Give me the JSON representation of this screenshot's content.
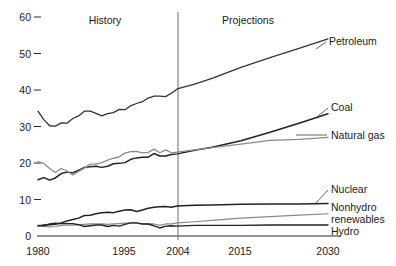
{
  "chart_data": {
    "type": "line",
    "title": "",
    "xlabel": "",
    "ylabel": "",
    "xlim": [
      1980,
      2030
    ],
    "ylim": [
      0,
      62
    ],
    "grid": false,
    "legend_position": "right-inline-labels",
    "x_ticks": [
      1980,
      1995,
      2004,
      2015,
      2030
    ],
    "y_ticks": [
      0,
      10,
      20,
      30,
      40,
      50,
      60
    ],
    "annotations": [
      {
        "text": "History",
        "x": 1991,
        "y": 60
      },
      {
        "text": "Projections",
        "x": 2016,
        "y": 60
      }
    ],
    "divider_x": 2004,
    "series": [
      {
        "name": "Petroleum",
        "color": "#333333",
        "width": 1.3,
        "label_x": 2031,
        "label_y": 52,
        "x": [
          1980,
          1981,
          1982,
          1983,
          1984,
          1985,
          1986,
          1987,
          1988,
          1989,
          1990,
          1991,
          1992,
          1993,
          1994,
          1995,
          1996,
          1997,
          1998,
          1999,
          2000,
          2001,
          2002,
          2003,
          2004,
          2007,
          2010,
          2015,
          2020,
          2025,
          2030
        ],
        "y": [
          34.2,
          31.9,
          30.2,
          30.1,
          31.0,
          30.9,
          32.2,
          32.9,
          34.2,
          34.2,
          33.6,
          32.9,
          33.5,
          33.8,
          34.7,
          34.6,
          35.7,
          36.3,
          36.8,
          37.8,
          38.3,
          38.3,
          38.2,
          39.1,
          40.3,
          41.6,
          43.2,
          46.2,
          48.9,
          51.4,
          54.0
        ]
      },
      {
        "name": "Coal",
        "color": "#222222",
        "width": 1.5,
        "label_x": 2031,
        "label_y": 34,
        "x": [
          1980,
          1981,
          1982,
          1983,
          1984,
          1985,
          1986,
          1987,
          1988,
          1989,
          1990,
          1991,
          1992,
          1993,
          1994,
          1995,
          1996,
          1997,
          1998,
          1999,
          2000,
          2001,
          2002,
          2003,
          2004,
          2007,
          2010,
          2015,
          2020,
          2025,
          2030
        ],
        "y": [
          15.4,
          16.0,
          15.3,
          15.9,
          17.1,
          17.5,
          17.3,
          18.0,
          18.8,
          19.0,
          19.1,
          18.8,
          19.1,
          19.8,
          19.9,
          20.1,
          21.0,
          21.4,
          21.6,
          21.6,
          22.6,
          21.9,
          21.9,
          22.3,
          22.5,
          23.5,
          24.3,
          26.1,
          28.4,
          30.9,
          33.5
        ]
      },
      {
        "name": "Natural gas",
        "color": "#8a8a8a",
        "width": 1.3,
        "label_x": 2031,
        "label_y": 28,
        "x": [
          1980,
          1981,
          1982,
          1983,
          1984,
          1985,
          1986,
          1987,
          1988,
          1989,
          1990,
          1991,
          1992,
          1993,
          1994,
          1995,
          1996,
          1997,
          1998,
          1999,
          2000,
          2001,
          2002,
          2003,
          2004,
          2007,
          2010,
          2015,
          2020,
          2025,
          2030
        ],
        "y": [
          20.4,
          19.9,
          18.5,
          17.4,
          18.5,
          17.8,
          16.7,
          17.7,
          18.6,
          19.7,
          19.7,
          20.1,
          20.8,
          21.3,
          21.7,
          22.7,
          23.1,
          23.2,
          22.8,
          22.9,
          23.8,
          22.8,
          23.6,
          22.8,
          23.0,
          23.6,
          24.2,
          25.2,
          26.2,
          26.5,
          27.0
        ]
      },
      {
        "name": "Nuclear",
        "color": "#222222",
        "width": 1.5,
        "label_x": 2031,
        "label_y": 11.5,
        "x": [
          1980,
          1981,
          1982,
          1983,
          1984,
          1985,
          1986,
          1987,
          1988,
          1989,
          1990,
          1991,
          1992,
          1993,
          1994,
          1995,
          1996,
          1997,
          1998,
          1999,
          2000,
          2001,
          2002,
          2003,
          2004,
          2007,
          2010,
          2015,
          2020,
          2025,
          2030
        ],
        "y": [
          2.7,
          3.0,
          3.1,
          3.2,
          3.6,
          4.1,
          4.5,
          4.9,
          5.6,
          5.7,
          6.1,
          6.4,
          6.5,
          6.4,
          6.8,
          7.1,
          7.2,
          6.7,
          7.1,
          7.6,
          7.9,
          8.0,
          8.1,
          7.9,
          8.2,
          8.4,
          8.5,
          8.7,
          8.8,
          8.8,
          8.9
        ]
      },
      {
        "name": "Nonhydro renewables",
        "color": "#8a8a8a",
        "width": 1.2,
        "label_x": 2031,
        "label_y": 6.8,
        "x": [
          1980,
          1981,
          1982,
          1983,
          1984,
          1985,
          1986,
          1987,
          1988,
          1989,
          1990,
          1991,
          1992,
          1993,
          1994,
          1995,
          1996,
          1997,
          1998,
          1999,
          2000,
          2001,
          2002,
          2003,
          2004,
          2007,
          2010,
          2015,
          2020,
          2025,
          2030
        ],
        "y": [
          2.7,
          2.6,
          2.5,
          2.6,
          2.9,
          3.0,
          3.0,
          3.1,
          3.2,
          3.3,
          3.3,
          3.3,
          3.2,
          3.3,
          3.4,
          3.5,
          3.5,
          3.5,
          3.3,
          3.3,
          3.3,
          2.9,
          3.3,
          3.3,
          3.6,
          3.9,
          4.3,
          4.9,
          5.3,
          5.7,
          6.1
        ]
      },
      {
        "name": "Hydro",
        "color": "#222222",
        "width": 1.4,
        "label_x": 2031,
        "label_y": 3.2,
        "x": [
          1980,
          1981,
          1982,
          1983,
          1984,
          1985,
          1986,
          1987,
          1988,
          1989,
          1990,
          1991,
          1992,
          1993,
          1994,
          1995,
          1996,
          1997,
          1998,
          1999,
          2000,
          2001,
          2002,
          2003,
          2004,
          2007,
          2010,
          2015,
          2020,
          2025,
          2030
        ],
        "y": [
          2.9,
          2.8,
          3.3,
          3.5,
          3.4,
          3.4,
          3.4,
          3.1,
          2.6,
          2.8,
          3.0,
          3.0,
          2.6,
          2.9,
          2.7,
          3.2,
          3.6,
          3.6,
          3.3,
          3.3,
          2.8,
          2.2,
          2.7,
          2.8,
          2.7,
          2.9,
          2.9,
          2.9,
          3.0,
          3.0,
          3.0
        ]
      }
    ]
  },
  "axis": {
    "y_tick_labels": [
      "0",
      "10",
      "20",
      "30",
      "40",
      "50",
      "60"
    ],
    "x_tick_labels": [
      "1980",
      "1995",
      "2004",
      "2015",
      "2030"
    ]
  },
  "periods": {
    "history": "History",
    "projections": "Projections"
  },
  "series_labels": {
    "petroleum": "Petroleum",
    "coal": "Coal",
    "natural_gas": "Natural gas",
    "nuclear": "Nuclear",
    "nonhydro_1": "Nonhydro",
    "nonhydro_2": "renewables",
    "hydro": "Hydro"
  },
  "colors": {
    "dark_line": "#222222",
    "gray_line": "#8a8a8a",
    "axis": "#2a2a2a",
    "divider": "#6b6b6b",
    "background": "#ffffff"
  }
}
